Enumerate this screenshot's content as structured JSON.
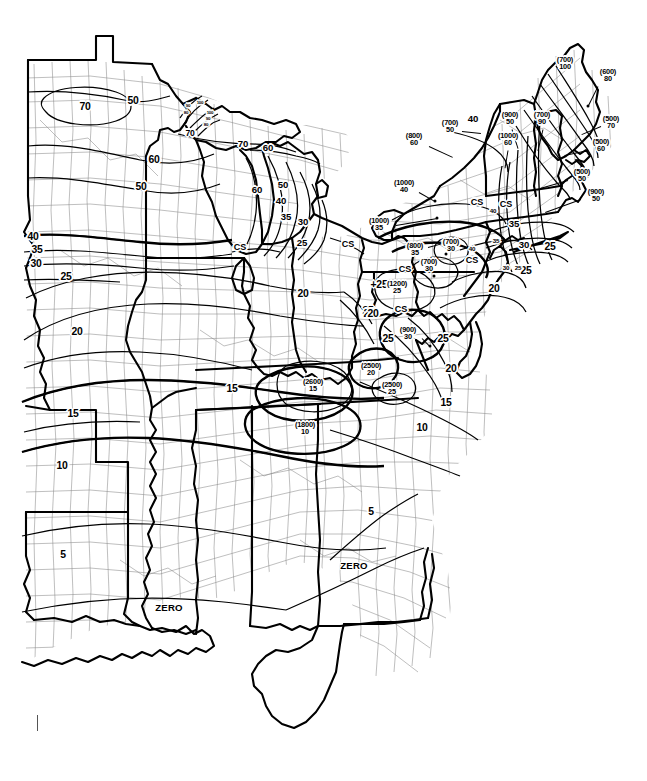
{
  "figure": {
    "kind": "ground-snow-load-contour-map",
    "region": "Eastern United States",
    "background_color": "#ffffff",
    "ink_color": "#000000",
    "county_line_color": "#6b6b6b",
    "corner_tick": "registration-tick"
  },
  "legend_symbols": {
    "cs": "CS",
    "zero": "ZERO",
    "paren_note": "(elevation in feet)"
  },
  "chart_data": {
    "type": "contour-map",
    "units": "pounds per square foot (psf)",
    "elevation_units": "feet",
    "contour_levels": [
      0,
      5,
      10,
      15,
      20,
      25,
      30,
      35,
      40,
      50,
      60,
      70,
      80,
      90,
      100
    ],
    "special_labels": [
      "CS",
      "ZERO"
    ],
    "note": "Numbers in parentheses are upper elevation limits in feet; the value below applies at and under that elevation. CS = case study required.",
    "contour_labels": [
      {
        "id": "c-70-mn",
        "text": "70",
        "x": 85,
        "y": 107,
        "size": "s-xl"
      },
      {
        "id": "c-50-mn",
        "text": "50",
        "x": 133,
        "y": 101,
        "size": "s-xl"
      },
      {
        "id": "c-60-wi",
        "text": "60",
        "x": 154,
        "y": 160,
        "size": "s-xl"
      },
      {
        "id": "c-50-wi",
        "text": "50",
        "x": 141,
        "y": 187,
        "size": "s-xl"
      },
      {
        "id": "c-70-up1",
        "text": "70",
        "x": 190,
        "y": 133,
        "size": "s-md"
      },
      {
        "id": "c-70-up2",
        "text": "70",
        "x": 243,
        "y": 144,
        "size": "s-lg"
      },
      {
        "id": "c-60-up",
        "text": "60",
        "x": 268,
        "y": 148,
        "size": "s-lg"
      },
      {
        "id": "c-90a",
        "text": "90",
        "x": 188,
        "y": 106,
        "size": "s-tiny"
      },
      {
        "id": "c-100a",
        "text": "100",
        "x": 200,
        "y": 103,
        "size": "s-tiny"
      },
      {
        "id": "c-80a",
        "text": "80",
        "x": 186,
        "y": 113,
        "size": "s-tiny"
      },
      {
        "id": "c-100b",
        "text": "100",
        "x": 210,
        "y": 113,
        "size": "s-tiny"
      },
      {
        "id": "c-90b",
        "text": "90",
        "x": 208,
        "y": 119,
        "size": "s-tiny"
      },
      {
        "id": "c-80b",
        "text": "80",
        "x": 206,
        "y": 125,
        "size": "s-tiny"
      },
      {
        "id": "c-60-mi",
        "text": "60",
        "x": 257,
        "y": 190,
        "size": "s-lg"
      },
      {
        "id": "c-50-mi",
        "text": "50",
        "x": 283,
        "y": 185,
        "size": "s-lg"
      },
      {
        "id": "c-40-mi",
        "text": "40",
        "x": 281,
        "y": 201,
        "size": "s-lg"
      },
      {
        "id": "c-35-mi",
        "text": "35",
        "x": 286,
        "y": 217,
        "size": "s-lg"
      },
      {
        "id": "c-30-mi",
        "text": "30",
        "x": 303,
        "y": 222,
        "size": "s-lg"
      },
      {
        "id": "c-25-mi",
        "text": "25",
        "x": 302,
        "y": 243,
        "size": "s-lg"
      },
      {
        "id": "c-40-ia",
        "text": "40",
        "x": 33,
        "y": 237,
        "size": "s-xl"
      },
      {
        "id": "c-35-ia",
        "text": "35",
        "x": 37,
        "y": 250,
        "size": "s-xl"
      },
      {
        "id": "c-30-ia",
        "text": "30",
        "x": 36,
        "y": 264,
        "size": "s-xl"
      },
      {
        "id": "c-25-ia",
        "text": "25",
        "x": 66,
        "y": 277,
        "size": "s-xl"
      },
      {
        "id": "c-20-mo",
        "text": "20",
        "x": 77,
        "y": 332,
        "size": "s-xl"
      },
      {
        "id": "c-20-in",
        "text": "20",
        "x": 303,
        "y": 294,
        "size": "s-xl"
      },
      {
        "id": "c-15-ky",
        "text": "15",
        "x": 232,
        "y": 389,
        "size": "s-xl"
      },
      {
        "id": "c-15-ar",
        "text": "15",
        "x": 73,
        "y": 414,
        "size": "s-xl"
      },
      {
        "id": "c-10-ar",
        "text": "10",
        "x": 62,
        "y": 466,
        "size": "s-xl"
      },
      {
        "id": "c-5-tx",
        "text": "5",
        "x": 63,
        "y": 555,
        "size": "s-xl"
      },
      {
        "id": "c-5-ga",
        "text": "5",
        "x": 371,
        "y": 512,
        "size": "s-xl"
      },
      {
        "id": "c-10-nc",
        "text": "10",
        "x": 422,
        "y": 428,
        "size": "s-xl"
      },
      {
        "id": "c-15-nc",
        "text": "15",
        "x": 446,
        "y": 403,
        "size": "s-xl"
      },
      {
        "id": "c-20-va",
        "text": "20",
        "x": 451,
        "y": 369,
        "size": "s-xl"
      },
      {
        "id": "c-25-va",
        "text": "25",
        "x": 443,
        "y": 339,
        "size": "s-xl"
      },
      {
        "id": "c-25-wv1",
        "text": "25",
        "x": 368,
        "y": 311,
        "size": "s-xl"
      },
      {
        "id": "c-20-wv",
        "text": "20",
        "x": 369,
        "y": 314,
        "size": "s-xl"
      },
      {
        "id": "c-25-oh",
        "text": "+25",
        "x": 379,
        "y": 285,
        "size": "s-xl"
      },
      {
        "id": "c-20-oh",
        "text": "20",
        "x": 373,
        "y": 314,
        "size": "s-xl"
      },
      {
        "id": "c-25-pa",
        "text": "25",
        "x": 388,
        "y": 339,
        "size": "s-xl"
      },
      {
        "id": "c-20-nj",
        "text": "20",
        "x": 494,
        "y": 289,
        "size": "s-xl"
      },
      {
        "id": "c-30-ny",
        "text": "30",
        "x": 524,
        "y": 245,
        "size": "s-lg"
      },
      {
        "id": "c-35-ny1",
        "text": "35",
        "x": 514,
        "y": 224,
        "size": "s-lg"
      },
      {
        "id": "c-35-ny2",
        "text": "35",
        "x": 496,
        "y": 241,
        "size": "s-xs"
      },
      {
        "id": "c-40-ny1",
        "text": "40",
        "x": 493,
        "y": 211,
        "size": "s-xs"
      },
      {
        "id": "c-40-ny2",
        "text": "40",
        "x": 472,
        "y": 249,
        "size": "s-xs"
      },
      {
        "id": "c-40-ne",
        "text": "40",
        "x": 473,
        "y": 119,
        "size": "s-lg"
      },
      {
        "id": "c-25-li",
        "text": "25",
        "x": 550,
        "y": 247,
        "size": "s-xl"
      },
      {
        "id": "c-25-ct",
        "text": "25",
        "x": 526,
        "y": 271,
        "size": "s-xl"
      },
      {
        "id": "c-30-ct",
        "text": "30",
        "x": 506,
        "y": 268,
        "size": "s-xs"
      },
      {
        "id": "c-25-ri",
        "text": "25",
        "x": 518,
        "y": 268,
        "size": "s-xs"
      }
    ],
    "elevation_labels": [
      {
        "id": "e-700-me",
        "paren": "(700)",
        "val": "100",
        "x": 565,
        "y": 63,
        "size": "s-sm",
        "dot": null,
        "leader": null
      },
      {
        "id": "e-600-me",
        "paren": "(600)",
        "val": "80",
        "x": 608,
        "y": 75,
        "size": "s-sm",
        "dot": [
          588,
          106
        ],
        "leader": [
          598,
          86,
          588,
          106
        ]
      },
      {
        "id": "e-500-me",
        "paren": "(500)",
        "val": "70",
        "x": 611,
        "y": 122,
        "size": "s-sm",
        "dot": null,
        "leader": [
          601,
          126,
          582,
          134
        ]
      },
      {
        "id": "e-500-nh",
        "paren": "(500)",
        "val": "60",
        "x": 601,
        "y": 145,
        "size": "s-sm",
        "dot": null,
        "leader": [
          588,
          150,
          565,
          155
        ]
      },
      {
        "id": "e-500-ma",
        "paren": "(500)",
        "val": "50",
        "x": 582,
        "y": 175,
        "size": "s-sm",
        "dot": null,
        "leader": [
          568,
          180,
          540,
          188
        ]
      },
      {
        "id": "e-900-ma",
        "paren": "(900)",
        "val": "50",
        "x": 596,
        "y": 195,
        "size": "s-sm",
        "dot": null,
        "leader": [
          581,
          199,
          545,
          212
        ]
      },
      {
        "id": "e-700-nh",
        "paren": "(700)",
        "val": "90",
        "x": 542,
        "y": 118,
        "size": "s-sm",
        "dot": null,
        "leader": [
          543,
          129,
          538,
          150
        ]
      },
      {
        "id": "e-900-vt",
        "paren": "(900)",
        "val": "50",
        "x": 510,
        "y": 118,
        "size": "s-sm",
        "dot": null,
        "leader": [
          512,
          129,
          518,
          148
        ]
      },
      {
        "id": "e-1000-vt",
        "paren": "(1000)",
        "val": "60",
        "x": 508,
        "y": 139,
        "size": "s-sm",
        "dot": null,
        "leader": [
          508,
          150,
          505,
          168
        ]
      },
      {
        "id": "e-700-ny",
        "paren": "(700)",
        "val": "50",
        "x": 450,
        "y": 126,
        "size": "s-sm",
        "dot": null,
        "leader": [
          462,
          131,
          481,
          133
        ]
      },
      {
        "id": "e-800-ny",
        "paren": "(800)",
        "val": "60",
        "x": 414,
        "y": 139,
        "size": "s-sm",
        "dot": null,
        "leader": [
          429,
          146,
          453,
          157
        ]
      },
      {
        "id": "e-1000-ny1",
        "paren": "(1000)",
        "val": "40",
        "x": 404,
        "y": 186,
        "size": "s-sm",
        "dot": [
          435,
          201
        ],
        "leader": [
          419,
          192,
          435,
          201
        ]
      },
      {
        "id": "e-1000-ny2",
        "paren": "(1000)",
        "val": "35",
        "x": 379,
        "y": 224,
        "size": "s-sm",
        "dot": [
          437,
          218
        ],
        "leader": [
          396,
          225,
          437,
          218
        ]
      },
      {
        "id": "e-800-pa",
        "paren": "(800)",
        "val": "35",
        "x": 415,
        "y": 249,
        "size": "s-sm",
        "dot": null,
        "leader": [
          428,
          247,
          443,
          243
        ]
      },
      {
        "id": "e-700-pa1",
        "paren": "(700)",
        "val": "30",
        "x": 451,
        "y": 245,
        "size": "s-sm",
        "dot": [
          446,
          254
        ],
        "leader": null
      },
      {
        "id": "e-700-pa2",
        "paren": "(700)",
        "val": "30",
        "x": 429,
        "y": 265,
        "size": "s-sm",
        "dot": [
          434,
          276
        ],
        "leader": null
      },
      {
        "id": "e-1200-pa",
        "paren": "(1200)",
        "val": "25",
        "x": 397,
        "y": 287,
        "size": "s-sm",
        "dot": null,
        "leader": null
      },
      {
        "id": "e-900-wv",
        "paren": "(900)",
        "val": "30",
        "x": 408,
        "y": 333,
        "size": "s-sm",
        "dot": [
          430,
          346
        ],
        "leader": [
          422,
          338,
          430,
          346
        ]
      },
      {
        "id": "e-2500-wv",
        "paren": "(2500)",
        "val": "20",
        "x": 371,
        "y": 369,
        "size": "s-sm",
        "dot": null,
        "leader": null
      },
      {
        "id": "e-2500-va",
        "paren": "(2500)",
        "val": "25",
        "x": 392,
        "y": 388,
        "size": "s-sm",
        "dot": null,
        "leader": null
      },
      {
        "id": "e-2600-ky",
        "paren": "(2600)",
        "val": "15",
        "x": 313,
        "y": 385,
        "size": "s-sm",
        "dot": null,
        "leader": null
      },
      {
        "id": "e-1800-tn",
        "paren": "(1800)",
        "val": "10",
        "x": 305,
        "y": 428,
        "size": "s-sm",
        "dot": null,
        "leader": null
      }
    ],
    "cs_labels": [
      {
        "id": "cs-chicago",
        "text": "CS",
        "x": 240,
        "y": 247
      },
      {
        "id": "cs-erie",
        "text": "CS",
        "x": 348,
        "y": 244
      },
      {
        "id": "cs-ohio",
        "text": "CS",
        "x": 405,
        "y": 269
      },
      {
        "id": "cs-wv",
        "text": "CS",
        "x": 401,
        "y": 309
      },
      {
        "id": "cs-ny-e",
        "text": "CS",
        "x": 477,
        "y": 202
      },
      {
        "id": "cs-ny-e2",
        "text": "CS",
        "x": 506,
        "y": 204
      },
      {
        "id": "cs-nj",
        "text": "CS",
        "x": 472,
        "y": 260
      }
    ],
    "zero_labels": [
      {
        "id": "zero-la",
        "text": "ZERO",
        "x": 169,
        "y": 608
      },
      {
        "id": "zero-ga",
        "text": "ZERO",
        "x": 354,
        "y": 566
      }
    ]
  }
}
